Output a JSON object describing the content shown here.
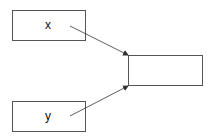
{
  "diagram": {
    "nodes": [
      {
        "id": "x",
        "label": "x",
        "x": 12,
        "y": 10,
        "w": 74,
        "h": 31,
        "label_x": 48,
        "label_y": 25
      },
      {
        "id": "y",
        "label": "y",
        "x": 12,
        "y": 101,
        "w": 74,
        "h": 31,
        "label_x": 48,
        "label_y": 116
      },
      {
        "id": "out",
        "label": "",
        "x": 128,
        "y": 55,
        "w": 75,
        "h": 31
      }
    ],
    "edges": [
      {
        "from": "x",
        "to": "out",
        "x1": 70,
        "y1": 26,
        "x2": 128,
        "y2": 55
      },
      {
        "from": "y",
        "to": "out",
        "x1": 70,
        "y1": 116,
        "x2": 128,
        "y2": 86
      }
    ],
    "colors": {
      "stroke": "#555555",
      "arrow": "#333333"
    }
  }
}
